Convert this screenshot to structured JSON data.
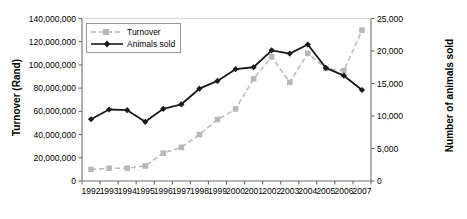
{
  "chart_data": {
    "type": "line",
    "title": "",
    "xlabel": "",
    "categories": [
      "1992",
      "1993",
      "1994",
      "1995",
      "1996",
      "1997",
      "1998",
      "1999",
      "2000",
      "2001",
      "2002",
      "2003",
      "2004",
      "2005",
      "2006",
      "2007"
    ],
    "grid": false,
    "legend_position": "top-left",
    "axes": {
      "left": {
        "label": "Turnover (Rand)",
        "min": 0,
        "max": 140000000,
        "step": 20000000,
        "ticks": [
          "0",
          "20,000,000",
          "40,000,000",
          "60,000,000",
          "80,000,000",
          "100,000,000",
          "120,000,000",
          "140,000,000"
        ],
        "tick_values": [
          0,
          20000000,
          40000000,
          60000000,
          80000000,
          100000000,
          120000000,
          140000000
        ]
      },
      "right": {
        "label": "Number of animals sold",
        "min": 0,
        "max": 25000,
        "step": 5000,
        "ticks": [
          "0",
          "5,000",
          "10,000",
          "15,000",
          "20,000",
          "25,000"
        ],
        "tick_values": [
          0,
          5000,
          10000,
          15000,
          20000,
          25000
        ]
      }
    },
    "series": [
      {
        "name": "Turnover",
        "axis": "left",
        "color": "#b8b8b8",
        "line_style": "dashed",
        "marker": "square",
        "values": [
          10000000,
          11000000,
          11000000,
          13000000,
          24000000,
          29000000,
          40000000,
          53000000,
          62000000,
          88000000,
          107000000,
          85000000,
          110000000,
          97000000,
          95000000,
          130000000
        ]
      },
      {
        "name": "Animals sold",
        "axis": "right",
        "color": "#1a1a1a",
        "line_style": "solid",
        "marker": "diamond",
        "values": [
          9500,
          11000,
          10900,
          9100,
          11100,
          11800,
          14200,
          15400,
          17200,
          17500,
          20100,
          19600,
          21000,
          17400,
          16200,
          14000
        ]
      }
    ]
  }
}
